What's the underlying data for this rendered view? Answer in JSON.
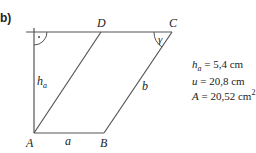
{
  "part_label": "b)",
  "vertices": {
    "A": {
      "label": "A",
      "x": 34,
      "y": 133
    },
    "B": {
      "label": "B",
      "x": 104,
      "y": 133
    },
    "C": {
      "label": "C",
      "x": 172,
      "y": 32
    },
    "D": {
      "label": "D",
      "x": 101,
      "y": 32
    }
  },
  "side_labels": {
    "a": "a",
    "b": "b",
    "h": "h",
    "h_sub": "a"
  },
  "angle_label": "γ",
  "right_angle_marker": "·",
  "given": [
    {
      "var": "h",
      "sub": "a",
      "eq": " = 5,4 cm"
    },
    {
      "var": "u",
      "sub": "",
      "eq": " = 20,8 cm"
    },
    {
      "var": "A",
      "sub": "",
      "eq": " = 20,52 cm",
      "sup": "2"
    }
  ],
  "colors": {
    "line": "#555555",
    "text": "#222222"
  }
}
